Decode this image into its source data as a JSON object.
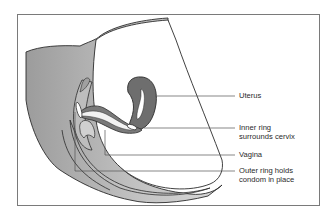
{
  "figure": {
    "labels": [
      {
        "id": "uterus",
        "text": [
          "Uterus"
        ]
      },
      {
        "id": "inner-ring",
        "text": [
          "Inner ring",
          "surrounds cervix"
        ]
      },
      {
        "id": "vagina",
        "text": [
          "Vagina"
        ]
      },
      {
        "id": "outer-ring",
        "text": [
          "Outer ring holds",
          "condom in place"
        ]
      }
    ]
  },
  "colors": {
    "body_fill": "#b3b3b3",
    "body_light": "#d6d6d6",
    "uterus_fill": "#6e6e6e",
    "outline": "#2b2b2b",
    "frame": "#7a7a7a",
    "leader": "#555555"
  }
}
